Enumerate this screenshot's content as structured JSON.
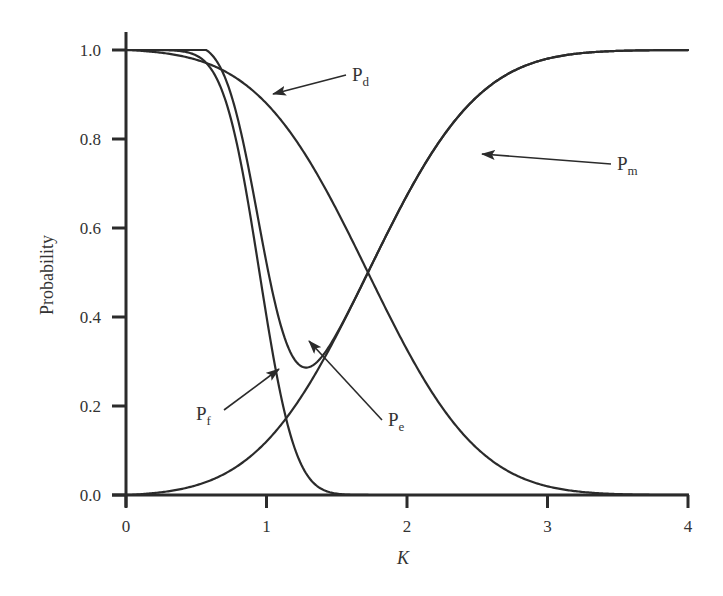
{
  "chart_data": {
    "type": "line",
    "title": "",
    "xlabel": "K",
    "ylabel": "Probability",
    "xlim": [
      0,
      4
    ],
    "ylim": [
      0,
      1.0
    ],
    "x_ticks": [
      "0",
      "1",
      "2",
      "3",
      "4"
    ],
    "y_ticks": [
      "0.0",
      "0.2",
      "0.4",
      "0.6",
      "0.8",
      "1.0"
    ],
    "grid": false,
    "legend": "none (inline arrow annotations)",
    "line_color": "#2b2b2b",
    "model": {
      "description": "Pf = Q((K - a)/s_f); Pd = Q((K - b)/s_d); Pm = 1 - Pd; Pe = Pf + Pm",
      "pf_center": 0.95,
      "pf_sigma": 0.2,
      "pd_center": 1.72,
      "pd_sigma": 0.62
    },
    "series": [
      {
        "name": "Pd",
        "label_main": "P",
        "label_sub": "d",
        "x": [
          0,
          0.5,
          0.8,
          1.0,
          1.2,
          1.5,
          1.72,
          2.0,
          2.5,
          3.0,
          3.5,
          4.0
        ],
        "values": [
          1.0,
          0.998,
          0.96,
          0.915,
          0.82,
          0.64,
          0.5,
          0.33,
          0.17,
          0.11,
          0.08,
          0.055
        ]
      },
      {
        "name": "Pm",
        "label_main": "P",
        "label_sub": "m",
        "x": [
          0,
          0.5,
          0.8,
          1.0,
          1.2,
          1.5,
          1.72,
          2.0,
          2.5,
          3.0,
          3.5,
          4.0
        ],
        "values": [
          0.0,
          0.002,
          0.04,
          0.085,
          0.18,
          0.36,
          0.5,
          0.67,
          0.83,
          0.89,
          0.92,
          0.945
        ]
      },
      {
        "name": "Pf",
        "label_main": "P",
        "label_sub": "f",
        "x": [
          0,
          0.5,
          0.7,
          0.85,
          0.95,
          1.05,
          1.2,
          1.4,
          1.6,
          1.8,
          2.0,
          4.0
        ],
        "values": [
          1.0,
          0.99,
          0.9,
          0.69,
          0.5,
          0.31,
          0.11,
          0.012,
          0.001,
          0.0,
          0.0,
          0.0
        ]
      },
      {
        "name": "Pe",
        "label_main": "P",
        "label_sub": "e",
        "x": [
          0,
          0.5,
          0.8,
          1.0,
          1.2,
          1.3,
          1.5,
          1.72,
          2.0,
          3.0,
          4.0
        ],
        "values": [
          1.0,
          0.99,
          0.81,
          0.44,
          0.38,
          0.355,
          0.37,
          0.5,
          0.67,
          0.89,
          0.945
        ]
      }
    ],
    "annotations": [
      {
        "target": "Pd",
        "text": "Pd",
        "label_px": [
          352,
          81
        ],
        "arrow_tip_px": [
          273,
          94
        ]
      },
      {
        "target": "Pm",
        "text": "Pm",
        "label_px": [
          617,
          170
        ],
        "arrow_tip_px": [
          482,
          154
        ]
      },
      {
        "target": "Pf",
        "text": "Pf",
        "label_px": [
          196,
          420
        ],
        "arrow_tip_px": [
          279,
          369
        ]
      },
      {
        "target": "Pe",
        "text": "Pe",
        "label_px": [
          388,
          426
        ],
        "arrow_tip_px": [
          309,
          341
        ]
      }
    ]
  }
}
